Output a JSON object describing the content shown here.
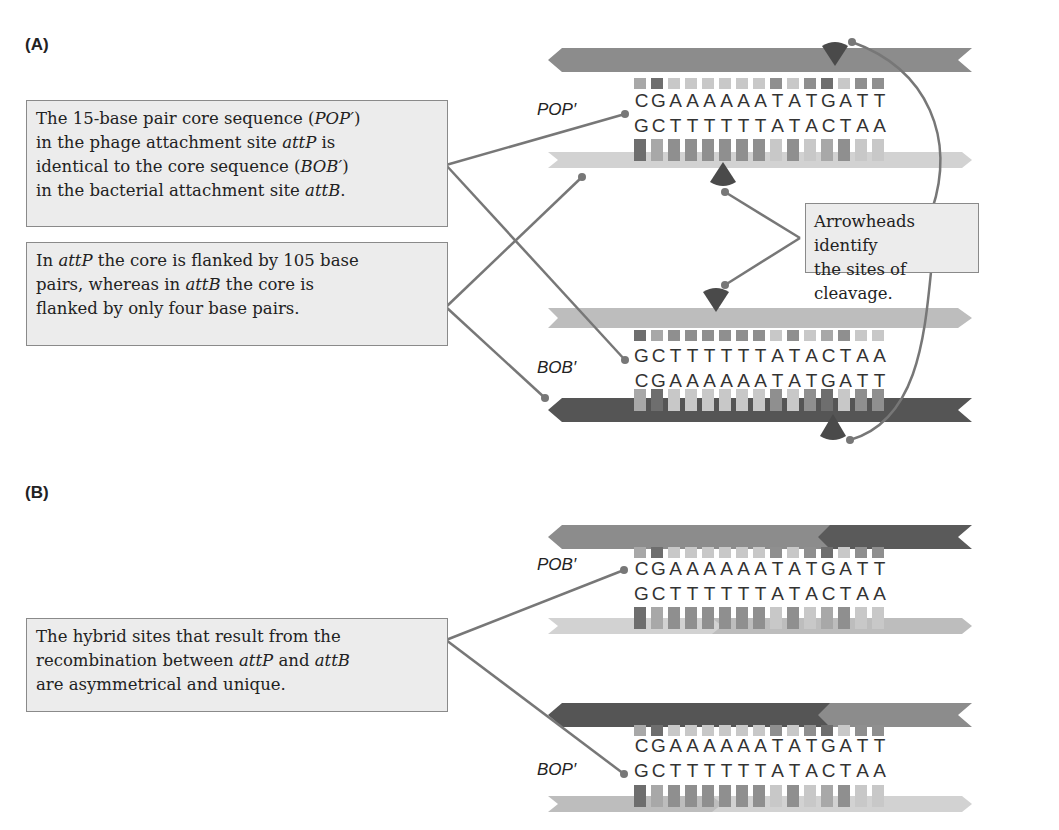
{
  "panels": {
    "A": {
      "label": "(A)",
      "callouts": {
        "core": {
          "l1a": "The 15-base pair core sequence (",
          "l1b": "POP′",
          "l1c": ")",
          "l2a": "in the phage attachment site ",
          "l2b": "attP",
          "l2c": " is",
          "l3a": "identical to the core sequence (",
          "l3b": "BOB′",
          "l3c": ")",
          "l4a": "in the bacterial attachment site ",
          "l4b": "attB",
          "l4c": "."
        },
        "flank": {
          "l1a": "In ",
          "l1b": "attP",
          "l1c": " the core is flanked by 105 base",
          "l2a": "pairs, whereas in ",
          "l2b": "attB",
          "l2c": " the core is",
          "l3": "flanked by only four base pairs."
        },
        "cleavage": {
          "l1": "Arrowheads identify",
          "l2": "the sites of cleavage."
        }
      },
      "sites": [
        {
          "name": "POP′",
          "top_seq": "CGAAAAAATATGATT",
          "bottom_seq": "GCTTTTTTATACTAA"
        },
        {
          "name": "BOB′",
          "top_seq": "GCTTTTTTATACTAA",
          "bottom_seq": "CGAAAAAATATGATT"
        }
      ]
    },
    "B": {
      "label": "(B)",
      "callouts": {
        "hybrid": {
          "l1": "The hybrid sites that result from the",
          "l2a": "recombination between ",
          "l2b": "attP",
          "l2c": " and ",
          "l2d": "attB",
          "l3": "are asymmetrical and unique."
        }
      },
      "sites": [
        {
          "name": "POB′",
          "top_seq": "CGAAAAAATATGATT",
          "bottom_seq": "GCTTTTTTATACTAA"
        },
        {
          "name": "BOP′",
          "top_seq": "CGAAAAAATATGATT",
          "bottom_seq": "GCTTTTTTATACTAA"
        }
      ]
    }
  },
  "colors": {
    "strand_medium": "#8c8c8c",
    "strand_light": "#cfcfcf",
    "strand_dark": "#5a5a5a",
    "connector": "#777777",
    "arrowhead": "#4a4a4a",
    "callout_bg": "#ececec",
    "callout_border": "#8a8a8a"
  }
}
